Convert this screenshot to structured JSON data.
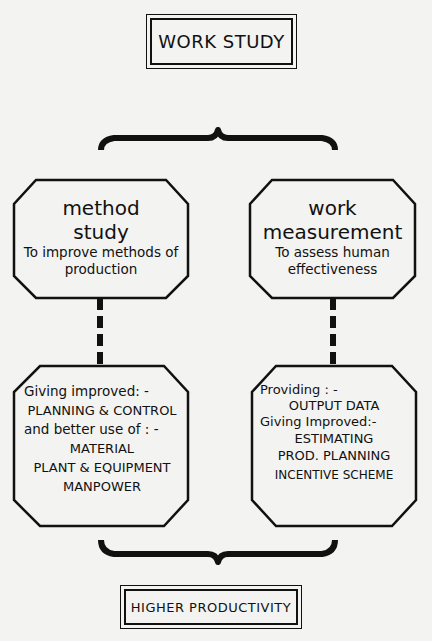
{
  "diagram": {
    "top": {
      "label": "WORK STUDY"
    },
    "branches": [
      {
        "title_line1": "method",
        "title_line2": "study",
        "purpose_line1": "To improve methods of",
        "purpose_line2": "production",
        "outcome": [
          "Giving improved: -",
          "PLANNING & CONTROL",
          "and better use of : -",
          "MATERIAL",
          "PLANT & EQUIPMENT",
          "MANPOWER"
        ]
      },
      {
        "title_line1": "work",
        "title_line2": "measurement",
        "purpose_line1": "To  assess human",
        "purpose_line2": "effectiveness",
        "outcome": [
          "Providing : -",
          "OUTPUT  DATA",
          "Giving Improved:-",
          "ESTIMATING",
          "PROD. PLANNING",
          "INCENTIVE SCHEME"
        ]
      }
    ],
    "bottom": {
      "label": "HIGHER PRODUCTIVITY"
    },
    "colors": {
      "ink": "#111111",
      "paper": "#f3f3f1"
    }
  }
}
